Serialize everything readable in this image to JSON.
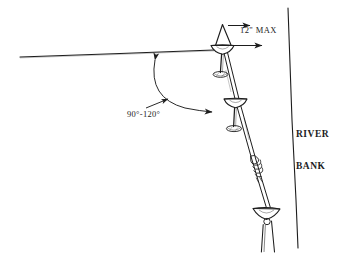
{
  "diagram": {
    "type": "technical-line-drawing",
    "background_color": "#ffffff",
    "ink_color": "#1d1d1d",
    "labels": {
      "dimension_max": "12\" MAX",
      "angle_range": "90°-120°",
      "river_bank_line_1": "RIVER",
      "river_bank_line_2": "BANK"
    },
    "annotations": [
      {
        "name": "dimension-callout",
        "text": "12\" MAX",
        "meaning": "Maximum 12 inch offset from anchor head to river bank",
        "arrow_count": 2,
        "arrow_direction": "right"
      },
      {
        "name": "angle-callout",
        "text": "90°-120°",
        "meaning": "Allowable included angle between ground line and guy line",
        "arrow_style": "double-headed-arc"
      },
      {
        "name": "river-bank-label",
        "text": "RIVER BANK",
        "meaning": "Identifies the near-vertical bank edge line"
      }
    ],
    "elements": [
      {
        "name": "ground-line",
        "description": "Horizontal grade line sloping slightly up to the right"
      },
      {
        "name": "apex-peak",
        "description": "Inverted-V peak at top of slope"
      },
      {
        "name": "anchor-top",
        "description": "Top earth anchor with dish head and stem"
      },
      {
        "name": "anchor-middle",
        "description": "Middle earth anchor with dish head, stem and coil"
      },
      {
        "name": "anchor-bottom",
        "description": "Bottom earth anchor at the river bank toe"
      },
      {
        "name": "guy-line",
        "description": "Diagonal twin-strand cable running from top anchor to bottom anchor"
      },
      {
        "name": "rope-coil",
        "description": "Rope coil / turnbuckle wrap on the guy line"
      },
      {
        "name": "river-bank-line",
        "description": "Near-vertical bank edge line on the right"
      }
    ]
  }
}
